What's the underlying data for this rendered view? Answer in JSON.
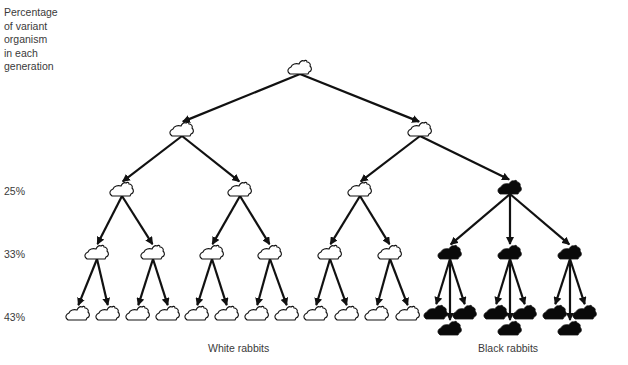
{
  "side_label": {
    "lines": [
      "Percentage",
      "of variant",
      "organism",
      "in each",
      "generation"
    ]
  },
  "percentages": [
    {
      "label": "25%",
      "y": 190
    },
    {
      "label": "33%",
      "y": 253
    },
    {
      "label": "43%",
      "y": 316
    }
  ],
  "group_labels": {
    "white": "White rabbits",
    "black": "Black rabbits"
  },
  "colors": {
    "line": "#111111",
    "white_rabbit_fill": "#ffffff",
    "black_rabbit_fill": "#0a0a0a",
    "text": "#3a3a3a"
  },
  "tree": {
    "nodes": [
      {
        "id": "g0",
        "x": 300,
        "y": 68,
        "color": "white"
      },
      {
        "id": "g1a",
        "x": 182,
        "y": 130,
        "color": "white"
      },
      {
        "id": "g1b",
        "x": 420,
        "y": 130,
        "color": "white"
      },
      {
        "id": "g2a",
        "x": 122,
        "y": 190,
        "color": "white"
      },
      {
        "id": "g2b",
        "x": 240,
        "y": 190,
        "color": "white"
      },
      {
        "id": "g2c",
        "x": 360,
        "y": 190,
        "color": "white"
      },
      {
        "id": "g2d",
        "x": 510,
        "y": 188,
        "color": "black"
      },
      {
        "id": "g3a",
        "x": 97,
        "y": 253,
        "color": "white"
      },
      {
        "id": "g3b",
        "x": 153,
        "y": 253,
        "color": "white"
      },
      {
        "id": "g3c",
        "x": 212,
        "y": 253,
        "color": "white"
      },
      {
        "id": "g3d",
        "x": 270,
        "y": 253,
        "color": "white"
      },
      {
        "id": "g3e",
        "x": 330,
        "y": 253,
        "color": "white"
      },
      {
        "id": "g3f",
        "x": 390,
        "y": 253,
        "color": "white"
      },
      {
        "id": "g3g",
        "x": 450,
        "y": 253,
        "color": "black"
      },
      {
        "id": "g3h",
        "x": 510,
        "y": 253,
        "color": "black"
      },
      {
        "id": "g3i",
        "x": 570,
        "y": 253,
        "color": "black"
      },
      {
        "id": "g4a1",
        "x": 78,
        "y": 314,
        "color": "white"
      },
      {
        "id": "g4a2",
        "x": 108,
        "y": 314,
        "color": "white"
      },
      {
        "id": "g4b1",
        "x": 138,
        "y": 314,
        "color": "white"
      },
      {
        "id": "g4b2",
        "x": 168,
        "y": 314,
        "color": "white"
      },
      {
        "id": "g4c1",
        "x": 197,
        "y": 314,
        "color": "white"
      },
      {
        "id": "g4c2",
        "x": 227,
        "y": 314,
        "color": "white"
      },
      {
        "id": "g4d1",
        "x": 257,
        "y": 314,
        "color": "white"
      },
      {
        "id": "g4d2",
        "x": 287,
        "y": 314,
        "color": "white"
      },
      {
        "id": "g4e1",
        "x": 316,
        "y": 314,
        "color": "white"
      },
      {
        "id": "g4e2",
        "x": 347,
        "y": 314,
        "color": "white"
      },
      {
        "id": "g4f1",
        "x": 377,
        "y": 314,
        "color": "white"
      },
      {
        "id": "g4f2",
        "x": 408,
        "y": 314,
        "color": "white"
      },
      {
        "id": "g4g1",
        "x": 436,
        "y": 313,
        "color": "black"
      },
      {
        "id": "g4g2",
        "x": 450,
        "y": 329,
        "color": "black"
      },
      {
        "id": "g4g3",
        "x": 465,
        "y": 313,
        "color": "black"
      },
      {
        "id": "g4h1",
        "x": 496,
        "y": 313,
        "color": "black"
      },
      {
        "id": "g4h2",
        "x": 510,
        "y": 329,
        "color": "black"
      },
      {
        "id": "g4h3",
        "x": 525,
        "y": 313,
        "color": "black"
      },
      {
        "id": "g4i1",
        "x": 555,
        "y": 313,
        "color": "black"
      },
      {
        "id": "g4i2",
        "x": 570,
        "y": 329,
        "color": "black"
      },
      {
        "id": "g4i3",
        "x": 585,
        "y": 313,
        "color": "black"
      }
    ],
    "edges": [
      [
        "g0",
        "g1a"
      ],
      [
        "g0",
        "g1b"
      ],
      [
        "g1a",
        "g2a"
      ],
      [
        "g1a",
        "g2b"
      ],
      [
        "g1b",
        "g2c"
      ],
      [
        "g1b",
        "g2d"
      ],
      [
        "g2a",
        "g3a"
      ],
      [
        "g2a",
        "g3b"
      ],
      [
        "g2b",
        "g3c"
      ],
      [
        "g2b",
        "g3d"
      ],
      [
        "g2c",
        "g3e"
      ],
      [
        "g2c",
        "g3f"
      ],
      [
        "g2d",
        "g3g"
      ],
      [
        "g2d",
        "g3h"
      ],
      [
        "g2d",
        "g3i"
      ],
      [
        "g3a",
        "g4a1"
      ],
      [
        "g3a",
        "g4a2"
      ],
      [
        "g3b",
        "g4b1"
      ],
      [
        "g3b",
        "g4b2"
      ],
      [
        "g3c",
        "g4c1"
      ],
      [
        "g3c",
        "g4c2"
      ],
      [
        "g3d",
        "g4d1"
      ],
      [
        "g3d",
        "g4d2"
      ],
      [
        "g3e",
        "g4e1"
      ],
      [
        "g3e",
        "g4e2"
      ],
      [
        "g3f",
        "g4f1"
      ],
      [
        "g3f",
        "g4f2"
      ],
      [
        "g3g",
        "g4g1"
      ],
      [
        "g3g",
        "g4g2"
      ],
      [
        "g3g",
        "g4g3"
      ],
      [
        "g3h",
        "g4h1"
      ],
      [
        "g3h",
        "g4h2"
      ],
      [
        "g3h",
        "g4h3"
      ],
      [
        "g3i",
        "g4i1"
      ],
      [
        "g3i",
        "g4i2"
      ],
      [
        "g3i",
        "g4i3"
      ]
    ]
  }
}
